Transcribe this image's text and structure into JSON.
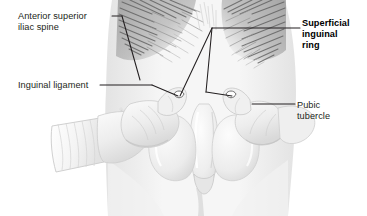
{
  "figure": {
    "background_color": "#ffffff",
    "width": 367,
    "height": 216,
    "line_color": "#231f20",
    "text_color": "#231f20"
  },
  "labels": {
    "anterior_superior_iliac_spine": {
      "line1": "Anterior superior",
      "line2": "iliac spine",
      "bold": false
    },
    "inguinal_ligament": {
      "line1": "Inguinal ligament",
      "bold": false
    },
    "superficial_inguinal_ring": {
      "line1": "Superficial",
      "line2": "inguinal",
      "line3": "ring",
      "bold": true
    },
    "pubic_tubercle": {
      "line1": "Pubic",
      "line2": "tubercle",
      "bold": false
    }
  },
  "illustration": {
    "subject": "male groin / inguinal region, frontal view",
    "elements": [
      "pubic-hair-hatching-left",
      "pubic-hair-hatching-right",
      "examiner-hand-left-with-cuffed-sleeve",
      "examiner-hand-right",
      "penis",
      "scrotum",
      "left-thigh",
      "right-thigh",
      "lower-abdomen"
    ]
  }
}
